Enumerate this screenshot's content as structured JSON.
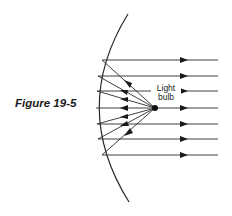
{
  "figure": {
    "caption": "Figure 19-5",
    "label_line1": "Light",
    "label_line2": "bulb",
    "colors": {
      "stroke": "#2a2a2a",
      "background": "#ffffff"
    }
  }
}
